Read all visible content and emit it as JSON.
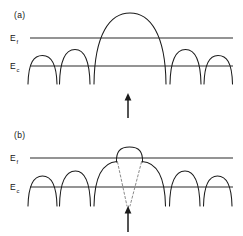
{
  "figure": {
    "title": "",
    "background_color": "#ffffff",
    "ink_color": "#1b1b1b",
    "dashed_color": "#7d7d7d",
    "width": 243,
    "height": 236
  },
  "panels": [
    {
      "id": "a",
      "tag": "(a)",
      "tag_x": 14,
      "tag_y": 18,
      "levels": [
        {
          "id": "fermi",
          "label_main": "E",
          "label_sub": "f",
          "label_x": 10,
          "label_y": 41,
          "line_y": 38,
          "line_x1": 30,
          "line_x2": 233
        },
        {
          "id": "conduction",
          "label_main": "E",
          "label_sub": "c",
          "label_x": 10,
          "label_y": 69,
          "line_y": 66,
          "line_x1": 30,
          "line_x2": 233
        }
      ],
      "arrow": {
        "id": "excitation-arrow",
        "x": 128,
        "y_tail": 118,
        "y_head": 94,
        "dashed": false
      },
      "wells": [
        {
          "x_left": 28,
          "x_right": 57,
          "peak_y": 56,
          "foot_y": 84
        },
        {
          "x_left": 57,
          "x_right": 92,
          "peak_y": 50,
          "foot_y": 84
        },
        {
          "x_left": 94,
          "x_right": 166,
          "peak_y": 13,
          "foot_y": 84
        },
        {
          "x_left": 168,
          "x_right": 203,
          "peak_y": 50,
          "foot_y": 84
        },
        {
          "x_left": 203,
          "x_right": 236,
          "peak_y": 56,
          "foot_y": 84
        }
      ]
    },
    {
      "id": "b",
      "tag": "(b)",
      "tag_x": 14,
      "tag_y": 138,
      "levels": [
        {
          "id": "fermi",
          "label_main": "E",
          "label_sub": "f",
          "label_x": 10,
          "label_y": 161,
          "line_y": 158,
          "line_x1": 30,
          "line_x2": 233
        },
        {
          "id": "conduction",
          "label_main": "E",
          "label_sub": "c",
          "label_x": 10,
          "label_y": 190,
          "line_y": 187,
          "line_x1": 30,
          "line_x2": 233
        }
      ],
      "arrow": {
        "id": "excitation-arrow",
        "x": 128,
        "y_tail": 232,
        "y_head": 207,
        "dashed": false
      },
      "wells": [
        {
          "x_left": 28,
          "x_right": 57,
          "peak_y": 176,
          "foot_y": 206
        },
        {
          "x_left": 57,
          "x_right": 92,
          "peak_y": 171,
          "foot_y": 206
        },
        {
          "x_left": 94,
          "x_right": 166,
          "peak_y": 155,
          "foot_y": 206
        },
        {
          "x_left": 168,
          "x_right": 203,
          "peak_y": 171,
          "foot_y": 206
        },
        {
          "x_left": 203,
          "x_right": 236,
          "peak_y": 176,
          "foot_y": 206
        }
      ],
      "trap_cap": {
        "id": "trap-state-cap",
        "x_left": 113,
        "x_right": 146,
        "top_y": 147,
        "bottom_y": 162
      },
      "dashed_guides": [
        {
          "x_top": 117,
          "y_top": 162,
          "x_bottom": 127,
          "y_bottom": 206
        },
        {
          "x_top": 142,
          "y_top": 162,
          "x_bottom": 130,
          "y_bottom": 206
        }
      ]
    }
  ]
}
